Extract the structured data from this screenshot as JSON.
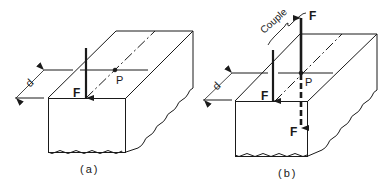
{
  "figure_a": {
    "caption": "(a)",
    "force_label": "F",
    "point_label": "P",
    "distance_label": "d"
  },
  "figure_b": {
    "caption": "(b)",
    "force_label_down": "F",
    "force_label_up": "F",
    "force_label_dashed": "F",
    "point_label": "P",
    "distance_label": "d",
    "couple_label": "Couple"
  },
  "colors": {
    "ink": "#1a1a1a",
    "background": "#ffffff"
  }
}
